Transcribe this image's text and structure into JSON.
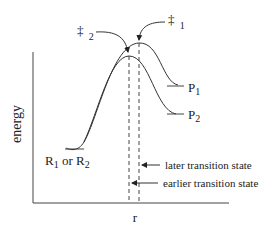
{
  "diagram": {
    "type": "reaction-energy-profile",
    "axes": {
      "y_label": "energy",
      "x_label": "r"
    },
    "transition_states": {
      "ts1_symbol": "‡",
      "ts1_subscript": "1",
      "ts2_symbol": "‡",
      "ts2_subscript": "2"
    },
    "reactant_label": {
      "r1": "R",
      "r1_sub": "1",
      "or": " or R",
      "r2_sub": "2"
    },
    "products": {
      "p1": "P",
      "p1_sub": "1",
      "p2": "P",
      "p2_sub": "2"
    },
    "annotations": {
      "later": "later transition state",
      "earlier": "earlier transition state"
    },
    "colors": {
      "line": "#333333",
      "text": "#222222",
      "background": "#ffffff"
    }
  }
}
